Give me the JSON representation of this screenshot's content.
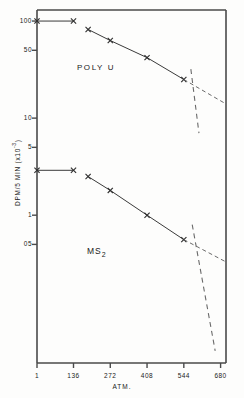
{
  "chart_data": {
    "type": "line",
    "title": "",
    "xlabel": "ATM.",
    "ylabel": "DPM/5 MIN (x10",
    "ylabel_exponent": "-3",
    "ylabel_suffix": ")",
    "xlim": [
      1,
      700
    ],
    "ylim": [
      0.03,
      130
    ],
    "yscale": "log",
    "xscale": "linear",
    "grid": false,
    "legend": "none",
    "xticks": [
      {
        "value": 1,
        "label": "1"
      },
      {
        "value": 136,
        "label": "136"
      },
      {
        "value": 272,
        "label": "272"
      },
      {
        "value": 408,
        "label": "408"
      },
      {
        "value": 544,
        "label": "544"
      },
      {
        "value": 680,
        "label": "680"
      }
    ],
    "yticks": [
      {
        "value": 100,
        "label": "100"
      },
      {
        "value": 50,
        "label": "50"
      },
      {
        "value": 10,
        "label": "10"
      },
      {
        "value": 5,
        "label": "5"
      },
      {
        "value": 1,
        "label": "1"
      },
      {
        "value": 0.5,
        "label": "05"
      }
    ],
    "annotations": [
      {
        "text": "POLY U",
        "x": 230,
        "y": 33
      },
      {
        "text": "MS",
        "subscript": "2",
        "x": 230,
        "y": 0.42
      }
    ],
    "series": [
      {
        "name": "POLY U",
        "marker": "x",
        "plateau": {
          "x": [
            1,
            136
          ],
          "y": [
            100,
            100
          ]
        },
        "x": [
          190,
          272,
          408,
          544
        ],
        "y": [
          82,
          63,
          42,
          25
        ],
        "dashed_extension": {
          "x": [
            544,
            700
          ],
          "y": [
            25,
            14
          ]
        }
      },
      {
        "name": "MS2",
        "marker": "x",
        "plateau": {
          "x": [
            1,
            136
          ],
          "y": [
            2.9,
            2.9
          ]
        },
        "x": [
          190,
          272,
          408,
          544
        ],
        "y": [
          2.5,
          1.8,
          1.0,
          0.56
        ],
        "dashed_extension": {
          "x": [
            544,
            700
          ],
          "y": [
            0.56,
            0.33
          ]
        }
      }
    ],
    "dashed_vertical_lines": [
      {
        "name": "poly-u-breakpoint",
        "x_top": 570,
        "y_top": 32,
        "x_bottom": 600,
        "y_bottom": 7.0
      },
      {
        "name": "ms2-breakpoint",
        "x_top": 575,
        "y_top": 0.8,
        "x_bottom": 660,
        "y_bottom": 0.04
      }
    ]
  },
  "axis": {
    "x_title": "ATM.",
    "y_title": "DPM/5 MIN (x10",
    "y_title_exp": "-3",
    "y_title_close": ")"
  },
  "labels": {
    "poly_u": "POLY U",
    "ms2_base": "MS",
    "ms2_sub": "2"
  },
  "style": {
    "line_color": "#3a3a3a",
    "axis_color": "#4a4a4a",
    "background": "#fdfdfc"
  }
}
